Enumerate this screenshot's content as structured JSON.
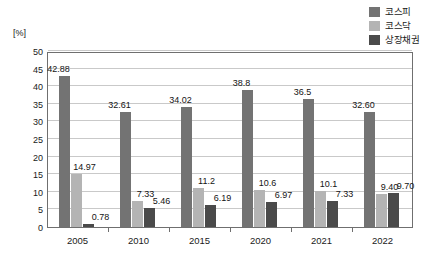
{
  "chart_data": {
    "type": "bar",
    "title": "",
    "xlabel": "",
    "ylabel": "[%]",
    "ylim": [
      0,
      50
    ],
    "ytick_step": 5,
    "yticks": [
      "50",
      "45",
      "40",
      "35",
      "30",
      "25",
      "20",
      "15",
      "10",
      "5",
      "0"
    ],
    "grid": true,
    "legend_position": "top-right",
    "categories": [
      "2005",
      "2010",
      "2015",
      "2020",
      "2021",
      "2022"
    ],
    "series": [
      {
        "name": "코스피",
        "color": "#737373",
        "values": [
          42.88,
          32.61,
          34.02,
          38.8,
          36.5,
          32.6
        ],
        "labels": [
          "42.88",
          "32.61",
          "34.02",
          "38.8",
          "36.5",
          "32.60"
        ]
      },
      {
        "name": "코스닥",
        "color": "#b4b4b4",
        "values": [
          14.97,
          7.33,
          11.2,
          10.6,
          10.1,
          9.4
        ],
        "labels": [
          "14.97",
          "7.33",
          "11.2",
          "10.6",
          "10.1",
          "9.40"
        ]
      },
      {
        "name": "상장채권",
        "color": "#4a4a4a",
        "values": [
          0.78,
          5.46,
          6.19,
          6.97,
          7.33,
          9.7
        ],
        "labels": [
          "0.78",
          "5.46",
          "6.19",
          "6.97",
          "7.33",
          "9.70"
        ]
      }
    ]
  },
  "legend": {
    "items": [
      {
        "label": "코스피",
        "color": "#737373"
      },
      {
        "label": "코스닥",
        "color": "#b4b4b4"
      },
      {
        "label": "상장채권",
        "color": "#4a4a4a"
      }
    ]
  },
  "axis": {
    "unit_label": "[%]"
  }
}
